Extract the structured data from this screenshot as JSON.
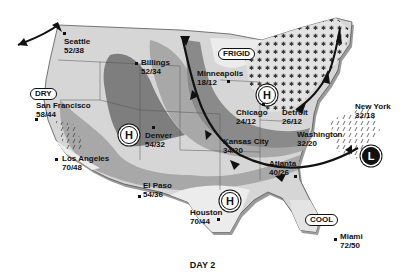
{
  "caption": "DAY 2",
  "labels": {
    "dry": "DRY",
    "frigid": "FRIGID",
    "cool": "COOL"
  },
  "pressure_centers": {
    "high_symbol": "H",
    "low_symbol": "L"
  },
  "cities": [
    {
      "name": "Seattle",
      "temps": "52/38"
    },
    {
      "name": "Billings",
      "temps": "52/34"
    },
    {
      "name": "Minneapolis",
      "temps": "18/12"
    },
    {
      "name": "San Francisco",
      "temps": "58/44"
    },
    {
      "name": "Denver",
      "temps": "54/32"
    },
    {
      "name": "Chicago",
      "temps": "24/12"
    },
    {
      "name": "Detroit",
      "temps": "26/12"
    },
    {
      "name": "New York",
      "temps": "32/18"
    },
    {
      "name": "Kansas City",
      "temps": "34/20"
    },
    {
      "name": "Washington",
      "temps": "32/20"
    },
    {
      "name": "Los Angeles",
      "temps": "70/48"
    },
    {
      "name": "Atlanta",
      "temps": "40/26"
    },
    {
      "name": "El Paso",
      "temps": "54/36"
    },
    {
      "name": "Houston",
      "temps": "70/44"
    },
    {
      "name": "Miami",
      "temps": "72/50"
    }
  ],
  "colors": {
    "land_light": "#d6d6d6",
    "band_mid": "#a8a8a8",
    "band_dark": "#7e7e7e",
    "lightest": "#ececec",
    "front": "#111111"
  }
}
